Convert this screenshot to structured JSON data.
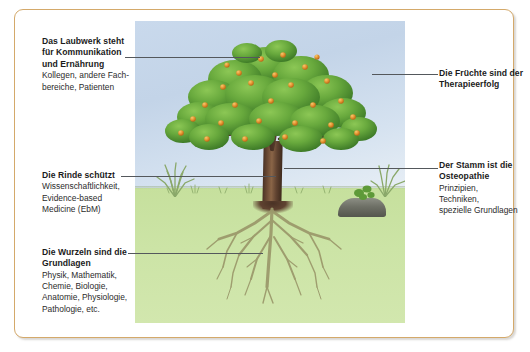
{
  "figure": {
    "border_color": "#d4a96a",
    "sky_color": "#c3d4e8",
    "ground_color": "#cbe3a3",
    "leaf_color": "#66a83c",
    "fruit_color": "#e4932f",
    "trunk_color": "#5f4230",
    "root_color": "#9a9a6a",
    "rock_color": "#6e7066"
  },
  "illustration": {
    "alt": "apple tree with visible root system",
    "parts": {
      "canopy": "foliage",
      "fruits": "apples",
      "trunk": "trunk",
      "bark": "bark",
      "roots": "roots",
      "ground": "soil",
      "grass": "grass tufts",
      "rock": "rock",
      "sky": "sky"
    }
  },
  "callouts": [
    {
      "id": "laubwerk",
      "side": "left",
      "heading": "Das Laubwerk steht\nfür Kommunikation\nund Ernährung",
      "body": "Kollegen, andere Fach-\nbereiche, Patienten"
    },
    {
      "id": "rinde",
      "side": "left",
      "heading": "Die Rinde schützt",
      "body": "Wissenschaftlichkeit,\nEvidence-based\nMedicine (EbM)"
    },
    {
      "id": "wurzeln",
      "side": "left",
      "heading": "Die Wurzeln sind die\nGrundlagen",
      "body": "Physik, Mathematik,\nChemie, Biologie,\nAnatomie, Physiologie,\nPathologie, etc."
    },
    {
      "id": "fruechte",
      "side": "right",
      "heading": "Die Früchte sind der\nTherapieerfolg",
      "body": ""
    },
    {
      "id": "stamm",
      "side": "right",
      "heading": "Der Stamm ist die\nOsteopathie",
      "body": "Prinzipien,\nTechniken,\nspezielle Grundlagen"
    }
  ]
}
